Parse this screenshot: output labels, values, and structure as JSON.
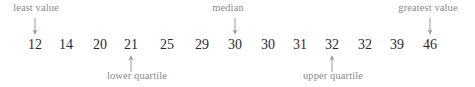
{
  "figure": {
    "type": "number-line-five-number-summary",
    "text_color": "#2b2b2b",
    "label_color": "#8a8a8a",
    "background": "#ffffff"
  },
  "values": [
    {
      "text": "12",
      "x": 35
    },
    {
      "text": "14",
      "x": 66
    },
    {
      "text": "20",
      "x": 100
    },
    {
      "text": "21",
      "x": 131
    },
    {
      "text": "25",
      "x": 167
    },
    {
      "text": "29",
      "x": 202
    },
    {
      "text": "30",
      "x": 235
    },
    {
      "text": "30",
      "x": 268
    },
    {
      "text": "31",
      "x": 300
    },
    {
      "text": "32",
      "x": 332
    },
    {
      "text": "32",
      "x": 365
    },
    {
      "text": "39",
      "x": 397
    },
    {
      "text": "46",
      "x": 430
    }
  ],
  "annotations": [
    {
      "name": "least-value",
      "label": "least value",
      "label_x": 36,
      "arrow_x": 35,
      "direction": "down",
      "target_value": "12"
    },
    {
      "name": "median",
      "label": "median",
      "label_x": 228,
      "arrow_x": 235,
      "direction": "down",
      "target_value": "30"
    },
    {
      "name": "greatest-value",
      "label": "greatest value",
      "label_x": 428,
      "arrow_x": 430,
      "direction": "down",
      "target_value": "46"
    },
    {
      "name": "lower-quartile",
      "label": "lower quartile",
      "label_x": 137,
      "arrow_x": 131,
      "direction": "up",
      "target_value": "21"
    },
    {
      "name": "upper-quartile",
      "label": "upper quartile",
      "label_x": 333,
      "arrow_x": 332,
      "direction": "up",
      "target_value": "32"
    }
  ],
  "chart_data": {
    "type": "table",
    "title": "",
    "categories": [
      "12",
      "14",
      "20",
      "21",
      "25",
      "29",
      "30",
      "30",
      "31",
      "32",
      "32",
      "39",
      "46"
    ],
    "values": [
      12,
      14,
      20,
      21,
      25,
      29,
      30,
      30,
      31,
      32,
      32,
      39,
      46
    ],
    "annotations": {
      "least value": 12,
      "lower quartile": 21,
      "median": 30,
      "upper quartile": 32,
      "greatest value": 46
    },
    "xlabel": "",
    "ylabel": ""
  }
}
